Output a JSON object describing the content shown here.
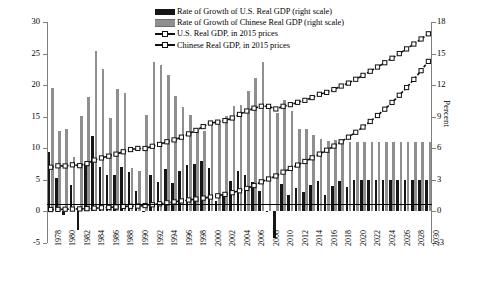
{
  "legend": {
    "items": [
      {
        "label": "Rate of Growth of U.S. Real GDP (right scale)",
        "marker": "black-bar-swatch"
      },
      {
        "label": "Rate of Growth of Chinese Real GDP (right scale)",
        "marker": "gray-bar-swatch"
      },
      {
        "label": "U.S. Real GDP, in 2015 prices",
        "marker": "dashed-line-open-square"
      },
      {
        "label": "Chinese Real GDP, in 2015 prices",
        "marker": "dashed-line-open-square"
      }
    ]
  },
  "axes": {
    "left_title": "USD trillions, 2015  prices",
    "right_title": "Percent",
    "left_ticks": [
      "30",
      "25",
      "20",
      "15",
      "10",
      "5",
      "0",
      "-5"
    ],
    "right_ticks": [
      "18",
      "15",
      "12",
      "9",
      "6",
      "3",
      "0",
      "-3"
    ]
  },
  "chart_data": {
    "type": "bar",
    "title": "",
    "xlabel": "",
    "ylabel": "USD trillions, 2015  prices",
    "y2label": "Percent",
    "ylim": [
      -5,
      30
    ],
    "y2lim": [
      -3,
      18
    ],
    "grid": false,
    "legend_position": "top-center",
    "x": [
      1978,
      1979,
      1980,
      1981,
      1982,
      1983,
      1984,
      1985,
      1986,
      1987,
      1988,
      1989,
      1990,
      1991,
      1992,
      1993,
      1994,
      1995,
      1996,
      1997,
      1998,
      1999,
      2000,
      2001,
      2002,
      2003,
      2004,
      2005,
      2006,
      2007,
      2008,
      2009,
      2010,
      2011,
      2012,
      2013,
      2014,
      2015,
      2016,
      2017,
      2018,
      2019,
      2020,
      2021,
      2022,
      2023,
      2024,
      2025,
      2026,
      2027,
      2028,
      2029,
      2030
    ],
    "categories": [
      "1978",
      "1979",
      "1980",
      "1981",
      "1982",
      "1983",
      "1984",
      "1985",
      "1986",
      "1987",
      "1988",
      "1989",
      "1990",
      "1991",
      "1992",
      "1993",
      "1994",
      "1995",
      "1996",
      "1997",
      "1998",
      "1999",
      "2000",
      "2001",
      "2002",
      "2003",
      "2004",
      "2005",
      "2006",
      "2007",
      "2008",
      "2009",
      "2010",
      "2011",
      "2012",
      "2013",
      "2014",
      "2015",
      "2016",
      "2017",
      "2018",
      "2019",
      "2020",
      "2021",
      "2022",
      "2023",
      "2024",
      "2025",
      "2026",
      "2027",
      "2028",
      "2029",
      "2030"
    ],
    "xtick_labels": [
      "1978",
      "1980",
      "1982",
      "1984",
      "1986",
      "1988",
      "1990",
      "1992",
      "1994",
      "1996",
      "1998",
      "2000",
      "2002",
      "2004",
      "2006",
      "2008",
      "2010",
      "2012",
      "2014",
      "2016",
      "2018",
      "2020",
      "2022",
      "2024",
      "2026",
      "2028",
      "2030"
    ],
    "series": [
      {
        "name": "Rate of Growth of U.S. Real GDP (right scale)",
        "kind": "bar",
        "axis": "right",
        "unit": "percent",
        "color": "#161616",
        "values": [
          5.6,
          3.2,
          -0.3,
          2.5,
          -1.8,
          4.6,
          7.2,
          4.2,
          3.5,
          3.5,
          4.2,
          3.7,
          1.9,
          -0.1,
          3.5,
          2.8,
          4.0,
          2.7,
          3.8,
          4.4,
          4.5,
          4.8,
          4.1,
          1.0,
          1.7,
          2.9,
          3.8,
          3.5,
          2.8,
          1.9,
          -0.1,
          -2.5,
          2.6,
          1.6,
          2.2,
          1.8,
          2.5,
          2.9,
          1.6,
          2.4,
          2.9,
          2.3,
          3.0,
          3.0,
          3.0,
          3.0,
          3.0,
          3.0,
          3.0,
          3.0,
          3.0,
          3.0,
          3.0
        ]
      },
      {
        "name": "Rate of Growth of Chinese Real GDP (right scale)",
        "kind": "bar",
        "axis": "right",
        "unit": "percent",
        "color": "#8f8f8f",
        "values": [
          11.7,
          7.6,
          7.8,
          5.2,
          9.1,
          10.9,
          15.2,
          13.5,
          8.9,
          11.6,
          11.3,
          4.1,
          3.8,
          9.2,
          14.2,
          13.9,
          13.0,
          11.0,
          9.9,
          9.2,
          7.8,
          7.6,
          8.4,
          8.3,
          9.1,
          10.0,
          10.1,
          11.4,
          12.7,
          14.2,
          9.7,
          9.4,
          10.6,
          9.5,
          7.8,
          7.8,
          7.3,
          6.9,
          6.7,
          6.8,
          6.6,
          6.6,
          6.6,
          6.6,
          6.6,
          6.6,
          6.6,
          6.6,
          6.6,
          6.6,
          6.6,
          6.6,
          6.6
        ]
      },
      {
        "name": "U.S. Real GDP, in 2015 prices",
        "kind": "line",
        "axis": "left",
        "unit": "USD trillions",
        "marker": "open-square",
        "linestyle": "dashed",
        "values": [
          7.0,
          7.22,
          7.2,
          7.38,
          7.25,
          7.58,
          8.13,
          8.47,
          8.76,
          9.07,
          9.45,
          9.8,
          9.98,
          9.97,
          10.32,
          10.61,
          11.03,
          11.33,
          11.76,
          12.28,
          12.83,
          13.44,
          14.0,
          14.14,
          14.38,
          14.8,
          15.36,
          15.9,
          16.35,
          16.66,
          16.64,
          16.23,
          16.65,
          16.91,
          17.28,
          17.59,
          18.03,
          18.55,
          18.85,
          19.3,
          19.86,
          20.32,
          20.93,
          21.55,
          22.2,
          22.87,
          23.55,
          24.26,
          24.99,
          25.74,
          26.51,
          27.31,
          28.13
        ]
      },
      {
        "name": "Chinese Real GDP, in 2015 prices",
        "kind": "line",
        "axis": "left",
        "unit": "USD trillions",
        "marker": "open-square",
        "linestyle": "dashed",
        "values": [
          0.3,
          0.32,
          0.35,
          0.37,
          0.4,
          0.44,
          0.51,
          0.58,
          0.63,
          0.71,
          0.79,
          0.82,
          0.85,
          0.93,
          1.06,
          1.21,
          1.36,
          1.51,
          1.66,
          1.82,
          1.96,
          2.11,
          2.28,
          2.47,
          2.7,
          2.97,
          3.27,
          3.64,
          4.1,
          4.69,
          5.14,
          5.62,
          6.22,
          6.81,
          7.34,
          7.91,
          8.49,
          9.08,
          9.69,
          10.35,
          11.03,
          11.76,
          12.54,
          13.37,
          14.25,
          15.19,
          16.19,
          17.26,
          18.4,
          19.62,
          20.91,
          22.29,
          23.76
        ]
      }
    ]
  }
}
